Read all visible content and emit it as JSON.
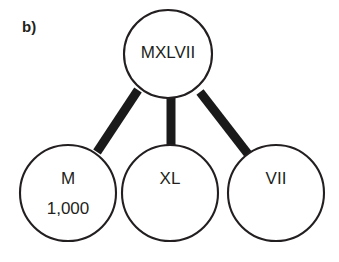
{
  "figure": {
    "panel_label": "b)",
    "background_color": "#ffffff",
    "stroke_color": "#231f20",
    "edge_color": "#1a1a1a"
  },
  "diagram": {
    "type": "tree-decomposition",
    "root": {
      "id": "root",
      "label": "MXLVII",
      "cx": 168,
      "cy": 54,
      "r": 44
    },
    "children": [
      {
        "id": "child-m",
        "label": "M",
        "sublabel": "1,000",
        "cx": 68,
        "cy": 193,
        "r": 48
      },
      {
        "id": "child-xl",
        "label": "XL",
        "sublabel": "",
        "cx": 170,
        "cy": 193,
        "r": 48
      },
      {
        "id": "child-vii",
        "label": "VII",
        "sublabel": "",
        "cx": 276,
        "cy": 193,
        "r": 48
      }
    ],
    "edges": [
      {
        "id": "edge-root-m",
        "from": "root",
        "to": "child-m",
        "x1": 138,
        "y1": 90,
        "x2": 97,
        "y2": 152
      },
      {
        "id": "edge-root-xl",
        "from": "root",
        "to": "child-xl",
        "x1": 171,
        "y1": 96,
        "x2": 171,
        "y2": 146
      },
      {
        "id": "edge-root-vii",
        "from": "root",
        "to": "child-vii",
        "x1": 200,
        "y1": 92,
        "x2": 248,
        "y2": 154
      }
    ]
  }
}
